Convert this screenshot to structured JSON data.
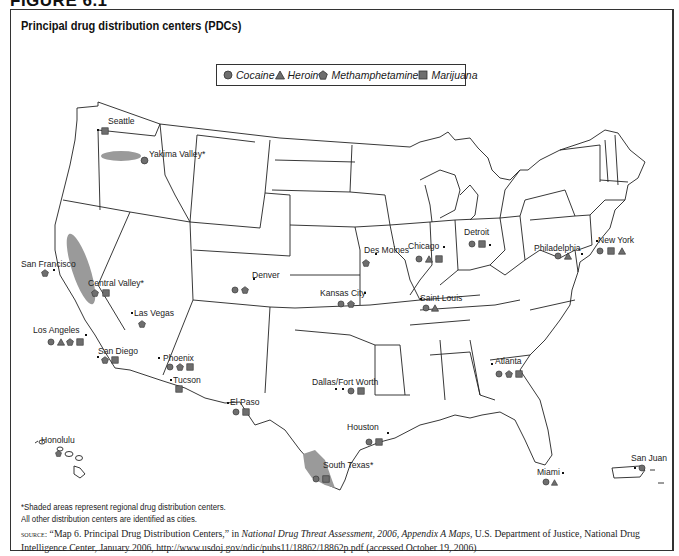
{
  "figure": {
    "label": "FIGURE 6.1",
    "title": "Principal drug distribution centers (PDCs)"
  },
  "legend": {
    "items": [
      {
        "label": "Cocaine",
        "shape": "circle"
      },
      {
        "label": "Heroin",
        "shape": "triangle"
      },
      {
        "label": "Methamphetamine",
        "shape": "pentagon"
      },
      {
        "label": "Marijuana",
        "shape": "square"
      }
    ]
  },
  "colors": {
    "marker_fill": "#6e6e6e",
    "marker_stroke": "#333333",
    "shaded_region": "#9a9a9a",
    "state_lines": "#222222",
    "frame": "#333333"
  },
  "cities": [
    {
      "name": "Seattle",
      "regional": false,
      "drugs": [
        "marijuana"
      ]
    },
    {
      "name": "Yakima Valley*",
      "regional": true,
      "drugs": [
        "cocaine"
      ]
    },
    {
      "name": "San Francisco",
      "regional": false,
      "drugs": [
        "methamphetamine"
      ]
    },
    {
      "name": "Central Valley*",
      "regional": true,
      "drugs": [
        "methamphetamine",
        "marijuana"
      ]
    },
    {
      "name": "Las Vegas",
      "regional": false,
      "drugs": [
        "methamphetamine"
      ]
    },
    {
      "name": "Los Angeles",
      "regional": false,
      "drugs": [
        "cocaine",
        "heroin",
        "methamphetamine",
        "marijuana"
      ]
    },
    {
      "name": "San Diego",
      "regional": false,
      "drugs": [
        "methamphetamine",
        "marijuana"
      ]
    },
    {
      "name": "Denver",
      "regional": false,
      "drugs": [
        "cocaine",
        "methamphetamine"
      ]
    },
    {
      "name": "Phoenix",
      "regional": false,
      "drugs": [
        "cocaine",
        "methamphetamine",
        "marijuana"
      ]
    },
    {
      "name": "Tucson",
      "regional": false,
      "drugs": [
        "marijuana"
      ]
    },
    {
      "name": "El Paso",
      "regional": false,
      "drugs": [
        "cocaine",
        "marijuana"
      ]
    },
    {
      "name": "Kansas City",
      "regional": false,
      "drugs": [
        "cocaine",
        "methamphetamine"
      ]
    },
    {
      "name": "Des Moines",
      "regional": false,
      "drugs": [
        "methamphetamine"
      ]
    },
    {
      "name": "Chicago",
      "regional": false,
      "drugs": [
        "cocaine",
        "heroin",
        "marijuana"
      ]
    },
    {
      "name": "Saint Louis",
      "regional": false,
      "drugs": [
        "cocaine",
        "heroin"
      ]
    },
    {
      "name": "Detroit",
      "regional": false,
      "drugs": [
        "cocaine",
        "marijuana"
      ]
    },
    {
      "name": "Dallas/Fort Worth",
      "regional": false,
      "drugs": [
        "cocaine",
        "marijuana"
      ]
    },
    {
      "name": "Houston",
      "regional": false,
      "drugs": [
        "cocaine",
        "marijuana"
      ]
    },
    {
      "name": "South Texas*",
      "regional": true,
      "drugs": [
        "cocaine",
        "marijuana"
      ]
    },
    {
      "name": "Atlanta",
      "regional": false,
      "drugs": [
        "cocaine",
        "methamphetamine",
        "marijuana"
      ]
    },
    {
      "name": "Miami",
      "regional": false,
      "drugs": [
        "cocaine",
        "heroin"
      ]
    },
    {
      "name": "Philadelphia",
      "regional": false,
      "drugs": [
        "cocaine",
        "heroin"
      ]
    },
    {
      "name": "New York",
      "regional": false,
      "drugs": [
        "cocaine",
        "marijuana",
        "heroin"
      ]
    },
    {
      "name": "Honolulu",
      "regional": false,
      "drugs": [
        "methamphetamine"
      ]
    },
    {
      "name": "San Juan",
      "regional": false,
      "drugs": [
        "cocaine"
      ]
    }
  ],
  "notes": {
    "line1": "*Shaded areas represent regional drug distribution centers.",
    "line2": "All other distribution centers are identified as cities."
  },
  "source": {
    "prefix": "source:",
    "text_a": " “Map 6. Principal Drug Distribution Centers,” in ",
    "italic": "National Drug Threat Assessment, 2006, Appendix A Maps",
    "text_b": ", U.S. Department of Justice, National Drug Intelligence Center, January 2006, http://www.usdoj.gov/ndic/pubs11/18862/18862p.pdf (accessed October 19, 2006)"
  }
}
